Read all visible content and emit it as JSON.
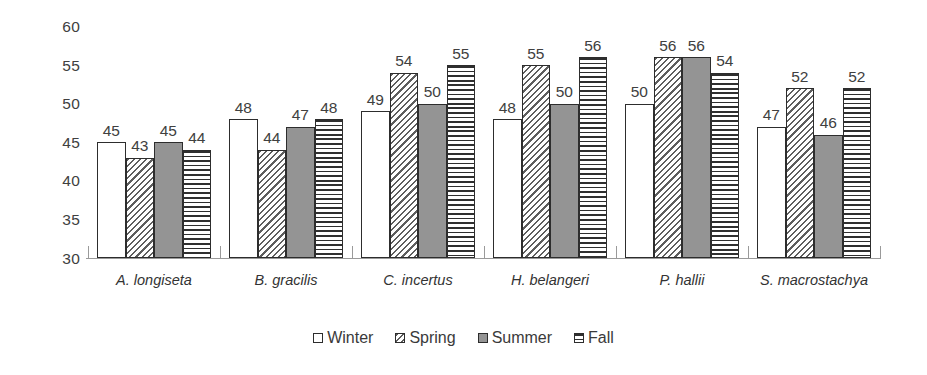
{
  "chart_data": {
    "type": "bar",
    "title": "",
    "subtitle": "",
    "xlabel": "",
    "ylabel": "",
    "ylim": [
      30,
      60
    ],
    "y_ticks": [
      30,
      35,
      40,
      45,
      50,
      55,
      60
    ],
    "grid": false,
    "legend_position": "bottom",
    "categories": [
      "A. longiseta",
      "B. gracilis",
      "C. incertus",
      "H. belangeri",
      "P. hallii",
      "S. macrostachya"
    ],
    "series": [
      {
        "name": "Winter",
        "pattern": "empty",
        "values": [
          45,
          48,
          49,
          48,
          50,
          47
        ]
      },
      {
        "name": "Spring",
        "pattern": "diagonal-hatch",
        "values": [
          43,
          44,
          54,
          55,
          56,
          52
        ]
      },
      {
        "name": "Summer",
        "pattern": "solid-gray",
        "values": [
          45,
          47,
          50,
          50,
          56,
          46
        ]
      },
      {
        "name": "Fall",
        "pattern": "horizontal-stripes",
        "values": [
          44,
          48,
          55,
          56,
          54,
          52
        ]
      }
    ],
    "colors": {
      "winter": "#ffffff",
      "spring": "#5e5e5e",
      "summer": "#949494",
      "fall": "#2f2f2f",
      "outline": "#2d2d2d",
      "axis": "#9a9a9a",
      "text": "#3a3a3a"
    }
  }
}
